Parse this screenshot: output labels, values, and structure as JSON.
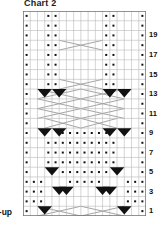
{
  "title": "Chart 2",
  "setup_label": "t-up",
  "colors": {
    "grid_line": "#b9b9b9",
    "grid_border": "#6e6e6e",
    "symbol_dark": "#111111",
    "cable_line": "#9a9a9a",
    "background": "#ffffff",
    "text": "#111111"
  },
  "chart_data": {
    "type": "table",
    "title": "Chart 2",
    "xlabel": "",
    "ylabel": "",
    "columns": 17,
    "rows": 21,
    "row_number_side": "right",
    "row_numbers_shown": [
      19,
      17,
      15,
      13,
      11,
      9,
      7,
      5,
      3,
      1
    ],
    "legend": [
      {
        "symbol": "dot",
        "name": "purl-stitch"
      },
      {
        "symbol": "blank",
        "name": "knit-stitch"
      },
      {
        "symbol": "cable-line",
        "name": "cable-cross-travel"
      },
      {
        "symbol": "filled-triangle",
        "name": "cable-cross-decrease"
      }
    ],
    "cells": [
      {
        "row": 21,
        "dots": [
          1,
          4,
          5,
          12,
          13,
          17
        ]
      },
      {
        "row": 20,
        "dots": [
          1,
          4,
          5,
          12,
          13,
          17
        ]
      },
      {
        "row": 19,
        "dots": [
          1,
          4,
          5,
          12,
          13,
          17
        ]
      },
      {
        "row": 18,
        "dots": [
          1,
          4,
          5,
          12,
          13,
          17
        ],
        "cable": "wide-x",
        "cable_cols": [
          6,
          11
        ]
      },
      {
        "row": 17,
        "dots": [
          1,
          4,
          5,
          12,
          13,
          17
        ]
      },
      {
        "row": 16,
        "dots": [
          1,
          4,
          5,
          12,
          13,
          17
        ]
      },
      {
        "row": 15,
        "dots": [
          1,
          4,
          5,
          12,
          13,
          17
        ]
      },
      {
        "row": 14,
        "dots": [
          1,
          4,
          5,
          12,
          13,
          17
        ],
        "cable": "wide-x",
        "cable_cols": [
          6,
          11
        ]
      },
      {
        "row": 13,
        "dots": [
          1,
          17
        ],
        "triangles": [
          3,
          5,
          12,
          14
        ],
        "cable": "double-x"
      },
      {
        "row": 12,
        "dots": [
          1,
          17
        ],
        "cable": "double-x"
      },
      {
        "row": 11,
        "dots": [
          1,
          17
        ],
        "cable": "double-x"
      },
      {
        "row": 10,
        "dots": [
          1,
          17
        ],
        "cable": "center-x"
      },
      {
        "row": 9,
        "dots": [
          1,
          6,
          7,
          8,
          9,
          10,
          11,
          12,
          17
        ],
        "triangles": [
          3,
          5,
          12,
          14
        ]
      },
      {
        "row": 8,
        "dots": [
          1,
          4,
          5,
          6,
          7,
          8,
          9,
          10,
          11,
          12,
          13,
          17
        ]
      },
      {
        "row": 7,
        "dots": [
          1,
          4,
          5,
          6,
          7,
          8,
          9,
          10,
          11,
          12,
          13,
          17
        ]
      },
      {
        "row": 6,
        "dots": [
          1,
          4,
          5,
          6,
          7,
          8,
          9,
          10,
          11,
          12,
          13,
          17
        ]
      },
      {
        "row": 5,
        "dots": [
          1,
          6,
          7,
          8,
          9,
          10,
          11,
          12,
          17
        ],
        "triangles": [
          4,
          13
        ]
      },
      {
        "row": 4,
        "dots": [
          1,
          2,
          3,
          7,
          8,
          9,
          10,
          11,
          15,
          16,
          17
        ]
      },
      {
        "row": 3,
        "dots": [
          1,
          2,
          3,
          15,
          16,
          17
        ],
        "triangles": [
          5,
          6,
          11,
          12
        ]
      },
      {
        "row": 2,
        "dots": [
          1,
          2,
          3,
          15,
          16,
          17
        ]
      },
      {
        "row": 1,
        "dots": [
          1,
          17
        ],
        "triangles": [
          3,
          14
        ],
        "cable": "double-x"
      }
    ]
  }
}
